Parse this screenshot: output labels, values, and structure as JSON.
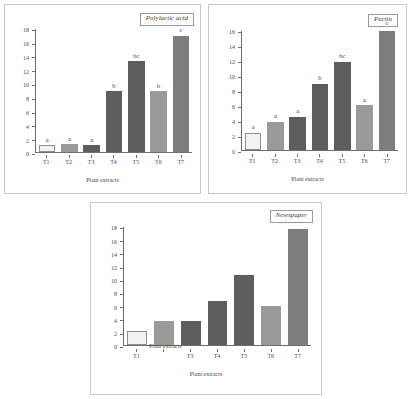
{
  "figure": {
    "xlabel": "Plant extracts",
    "colors": {
      "white": "#f2f2ee",
      "white_border": "#8f8f8f",
      "medium": "#9a9a9a",
      "dark": "#5d5d5d",
      "mid_dark": "#7d7d7d"
    }
  },
  "chart_data": [
    {
      "type": "bar",
      "title": "Polylactic acid",
      "xlabel": "Plant extracts",
      "ylabel": "",
      "categories": [
        "T1",
        "T2",
        "T3",
        "T4",
        "T5",
        "T6",
        "T7"
      ],
      "values": [
        1.0,
        1.1,
        1.0,
        8.9,
        13.3,
        8.9,
        17.0
      ],
      "annotations": [
        "a",
        "a",
        "a",
        "b",
        "bc",
        "b",
        "c"
      ],
      "bar_colors": [
        "white",
        "medium",
        "dark",
        "dark",
        "dark",
        "medium",
        "mid_dark"
      ],
      "ylim": [
        0,
        18
      ],
      "yticks": [
        0,
        2,
        4,
        6,
        8,
        10,
        12,
        14,
        16,
        18
      ],
      "grid": false,
      "legend": "none"
    },
    {
      "type": "bar",
      "title": "Pectin",
      "xlabel": "Plant extracts",
      "ylabel": "",
      "categories": [
        "T1",
        "T2",
        "T3",
        "T4",
        "T5",
        "T6",
        "T7"
      ],
      "values": [
        2.3,
        3.8,
        4.5,
        8.9,
        11.9,
        6.0,
        16.3
      ],
      "annotations": [
        "a",
        "a",
        "a",
        "b",
        "bc",
        "a",
        "c"
      ],
      "bar_colors": [
        "white",
        "medium",
        "dark",
        "dark",
        "dark",
        "medium",
        "mid_dark"
      ],
      "ylim": [
        0,
        16
      ],
      "yticks": [
        0,
        2,
        4,
        6,
        8,
        10,
        12,
        14,
        16
      ],
      "grid": false,
      "legend": "none"
    },
    {
      "type": "bar",
      "title": "Newspaper",
      "xlabel": "Plant extracts",
      "ylabel": "",
      "categories": [
        "T1",
        "Plant extracts",
        "T3",
        "T4",
        "T5",
        "T6",
        "T7",
        ""
      ],
      "values": [
        2.1,
        3.7,
        3.7,
        6.7,
        10.7,
        5.9,
        17.7
      ],
      "annotations": [
        "",
        "",
        "",
        "",
        "",
        "",
        ""
      ],
      "bar_colors": [
        "white",
        "medium",
        "dark",
        "dark",
        "dark",
        "medium",
        "mid_dark"
      ],
      "ylim": [
        0,
        18
      ],
      "yticks": [
        0,
        2,
        4,
        6,
        8,
        10,
        12,
        14,
        16,
        18
      ],
      "grid": false,
      "legend": "none",
      "note": "overlapping axis label text rendered over T2 tick position"
    }
  ]
}
